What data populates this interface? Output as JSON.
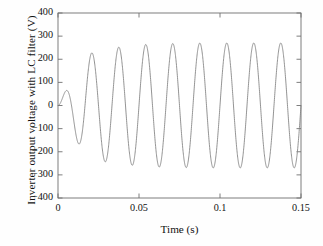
{
  "chart_data": {
    "type": "line",
    "title": "",
    "xlabel": "Time (s)",
    "ylabel": "Inverter output voltage with LC filter (V)",
    "xlim": [
      0,
      0.15
    ],
    "ylim": [
      -400,
      400
    ],
    "xticks": [
      "0",
      "0.05",
      "0.1",
      "0.15"
    ],
    "xtick_values": [
      0,
      0.05,
      0.1,
      0.15
    ],
    "yticks": [
      "400",
      "300",
      "200",
      "100",
      "0",
      "−100",
      "−200",
      "−300",
      "−400"
    ],
    "ytick_values": [
      400,
      300,
      200,
      100,
      0,
      -100,
      -200,
      -300,
      -400
    ],
    "grid": false,
    "legend": null,
    "line_color": "#808080",
    "line_width": 0.8,
    "frequency_hz": 60,
    "series": [
      {
        "name": "Inverter output voltage with LC filter",
        "description": "60 Hz sinusoid with startup transient settling to steady-state amplitude ~272 V",
        "peaks": [
          {
            "t": 0.0083,
            "v": 112
          },
          {
            "t": 0.025,
            "v": 240
          },
          {
            "t": 0.0415,
            "v": 257
          },
          {
            "t": 0.058,
            "v": 267
          },
          {
            "t": 0.0745,
            "v": 270
          },
          {
            "t": 0.0912,
            "v": 272
          },
          {
            "t": 0.1078,
            "v": 272
          },
          {
            "t": 0.1245,
            "v": 272
          },
          {
            "t": 0.1412,
            "v": 272
          }
        ],
        "troughs": [
          {
            "t": 0.0167,
            "v": -215
          },
          {
            "t": 0.0332,
            "v": -247
          },
          {
            "t": 0.0498,
            "v": -260
          },
          {
            "t": 0.0663,
            "v": -265
          },
          {
            "t": 0.083,
            "v": -267
          },
          {
            "t": 0.0995,
            "v": -268
          },
          {
            "t": 0.1162,
            "v": -268
          },
          {
            "t": 0.1328,
            "v": -268
          },
          {
            "t": 0.1495,
            "v": -268
          }
        ]
      }
    ]
  },
  "axes": {
    "ylabel": "Inverter output voltage with LC filter (V)",
    "xlabel": "Time (s)"
  }
}
